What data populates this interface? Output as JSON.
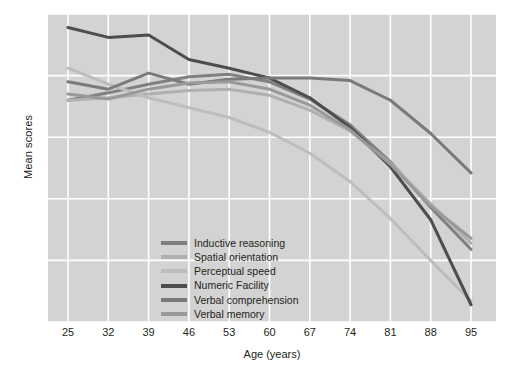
{
  "chart_data": {
    "type": "line",
    "title": "",
    "xlabel": "Age (years)",
    "ylabel": "Mean scores",
    "x": [
      25,
      32,
      39,
      46,
      53,
      60,
      67,
      74,
      81,
      88,
      95
    ],
    "xlim": [
      25,
      95
    ],
    "ylim": [
      30,
      55
    ],
    "xticks": [
      "25",
      "32",
      "39",
      "46",
      "53",
      "60",
      "67",
      "74",
      "81",
      "88",
      "95"
    ],
    "yticks": [
      "30",
      "35",
      "40",
      "45",
      "50",
      "55"
    ],
    "grid": true,
    "grid_color": "#ffffff",
    "plot_background": "#d3d3d3",
    "legend_position": "lower-left-inset",
    "series": [
      {
        "name": "Inductive reasoning",
        "color": "#808080",
        "values": [
          48.0,
          48.6,
          49.3,
          49.9,
          50.1,
          49.5,
          48.1,
          46.0,
          43.0,
          39.3,
          35.9
        ]
      },
      {
        "name": "Spatial orientation",
        "color": "#b0b0b0",
        "values": [
          48.0,
          48.2,
          48.5,
          48.8,
          48.9,
          48.4,
          47.2,
          45.5,
          42.9,
          39.6,
          36.4
        ]
      },
      {
        "name": "Perceptual speed",
        "color": "#bdbdbd",
        "values": [
          50.6,
          49.3,
          48.2,
          47.4,
          46.6,
          45.4,
          43.7,
          41.4,
          38.4,
          35.0,
          31.7
        ]
      },
      {
        "name": "Numeric Facility",
        "color": "#4d4d4d",
        "values": [
          53.9,
          53.1,
          53.3,
          51.3,
          50.6,
          49.8,
          48.2,
          45.8,
          42.6,
          38.3,
          31.4
        ]
      },
      {
        "name": "Verbal comprehension",
        "color": "#7a7a7a",
        "values": [
          49.5,
          48.9,
          50.2,
          49.3,
          49.7,
          49.8,
          49.8,
          49.6,
          48.0,
          45.3,
          42.1
        ]
      },
      {
        "name": "Verbal memory",
        "color": "#999999",
        "values": [
          48.5,
          48.1,
          48.9,
          49.4,
          49.5,
          48.9,
          47.6,
          45.6,
          42.8,
          39.4,
          36.8
        ]
      }
    ]
  }
}
